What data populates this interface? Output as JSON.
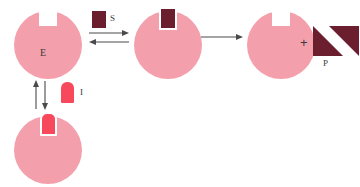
{
  "diagram": {
    "colors": {
      "enzyme_pink": "#f4a0ac",
      "substrate_maroon": "#6b1f2e",
      "inhibitor_red": "#f8485c",
      "arrow_gray": "#4a4a4a",
      "label_dark": "#3a3a3a",
      "background": "#ffffff"
    },
    "labels": {
      "enzyme": "E",
      "substrate": "S",
      "inhibitor": "I",
      "product": "P",
      "plus": "+"
    },
    "nodes": [
      {
        "id": "free-enzyme",
        "label": "E",
        "shape": "circle-with-notch",
        "color": "#f4a0ac"
      },
      {
        "id": "substrate",
        "label": "S",
        "shape": "rectangle",
        "color": "#6b1f2e"
      },
      {
        "id": "es-complex",
        "label": "",
        "shape": "circle-with-bound-substrate",
        "color": "#f4a0ac"
      },
      {
        "id": "enzyme-released",
        "label": "",
        "shape": "circle-with-notch",
        "color": "#f4a0ac"
      },
      {
        "id": "products",
        "label": "P",
        "shape": "two-triangles",
        "color": "#6b1f2e"
      },
      {
        "id": "inhibitor",
        "label": "I",
        "shape": "dome",
        "color": "#f8485c"
      },
      {
        "id": "ei-complex",
        "label": "",
        "shape": "circle-with-bound-inhibitor",
        "color": "#f4a0ac"
      }
    ],
    "arrows": [
      {
        "id": "binding-equilibrium",
        "type": "reversible-horizontal",
        "direction": "bidirectional"
      },
      {
        "id": "catalysis",
        "type": "single-horizontal",
        "direction": "right"
      },
      {
        "id": "inhibition-equilibrium",
        "type": "reversible-vertical",
        "direction": "bidirectional"
      }
    ]
  }
}
